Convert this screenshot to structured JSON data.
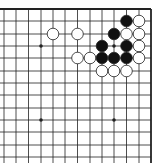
{
  "diagram": {
    "type": "go-board-fragment",
    "board_size": 19,
    "visible_region": "upper-right corner (top and right edges shown)",
    "colors": {
      "background": "#ffffff",
      "line": "#222222",
      "black_stone": "#111111",
      "white_stone": "#ffffff",
      "stone_outline": "#222222"
    },
    "grid": {
      "columns_x": [
        4,
        16,
        28.5,
        41,
        53,
        65,
        77.5,
        90,
        102,
        114,
        126.5,
        139,
        151
      ],
      "rows_y": [
        9,
        21,
        34,
        46,
        58,
        71,
        83,
        95,
        108,
        120,
        132,
        145,
        157
      ],
      "top_edge_y": 9,
      "right_edge_x": 151
    },
    "star_points": [
      {
        "col_from_right": 4,
        "row_from_top": 4
      },
      {
        "col_from_right": 10,
        "row_from_top": 4
      },
      {
        "col_from_right": 4,
        "row_from_top": 10
      },
      {
        "col_from_right": 10,
        "row_from_top": 10
      }
    ],
    "stones": [
      {
        "color": "black",
        "col_from_right": 3,
        "row_from_top": 2
      },
      {
        "color": "white",
        "col_from_right": 2,
        "row_from_top": 2
      },
      {
        "color": "white",
        "col_from_right": 9,
        "row_from_top": 3
      },
      {
        "color": "white",
        "col_from_right": 7,
        "row_from_top": 3
      },
      {
        "color": "black",
        "col_from_right": 4,
        "row_from_top": 3
      },
      {
        "color": "white",
        "col_from_right": 3,
        "row_from_top": 3
      },
      {
        "color": "white",
        "col_from_right": 2,
        "row_from_top": 3
      },
      {
        "color": "black",
        "col_from_right": 5,
        "row_from_top": 4
      },
      {
        "color": "black",
        "col_from_right": 3,
        "row_from_top": 4
      },
      {
        "color": "white",
        "col_from_right": 2,
        "row_from_top": 4
      },
      {
        "color": "white",
        "col_from_right": 7,
        "row_from_top": 5
      },
      {
        "color": "white",
        "col_from_right": 6,
        "row_from_top": 5
      },
      {
        "color": "black",
        "col_from_right": 5,
        "row_from_top": 5
      },
      {
        "color": "black",
        "col_from_right": 4,
        "row_from_top": 5
      },
      {
        "color": "black",
        "col_from_right": 3,
        "row_from_top": 5
      },
      {
        "color": "white",
        "col_from_right": 2,
        "row_from_top": 5
      },
      {
        "color": "white",
        "col_from_right": 5,
        "row_from_top": 6
      },
      {
        "color": "white",
        "col_from_right": 4,
        "row_from_top": 6
      },
      {
        "color": "white",
        "col_from_right": 3,
        "row_from_top": 6
      }
    ],
    "stone_radius": 5.8
  }
}
